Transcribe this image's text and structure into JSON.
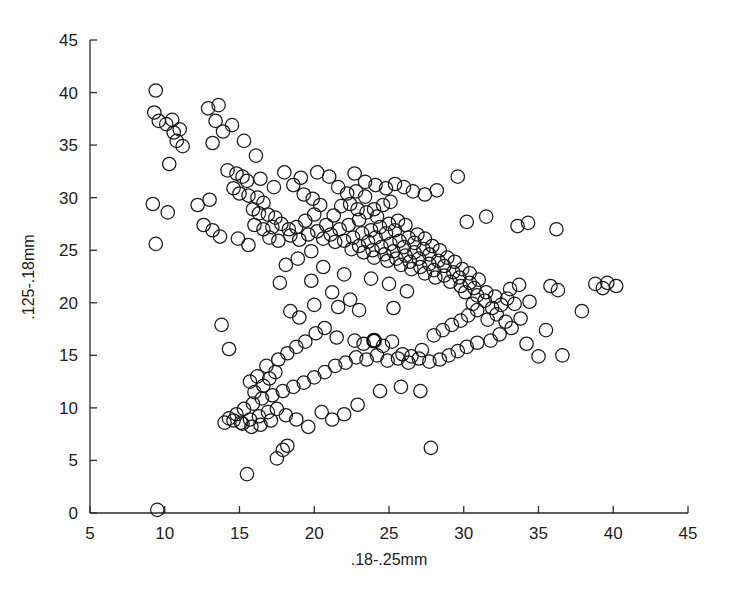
{
  "chart_data": {
    "type": "scatter",
    "title": "",
    "xlabel": ".18-.25mm",
    "ylabel": ".125-.18mm",
    "xlim": [
      5,
      45
    ],
    "ylim": [
      0,
      45
    ],
    "xticks": [
      5,
      10,
      15,
      20,
      25,
      30,
      35,
      40,
      45
    ],
    "yticks": [
      0,
      5,
      10,
      15,
      20,
      25,
      30,
      35,
      40,
      45
    ],
    "xtick_labels": [
      "5",
      "10",
      "15",
      "20",
      "25",
      "30",
      "35",
      "40",
      "45"
    ],
    "ytick_labels": [
      "0",
      "5",
      "10",
      "15",
      "20",
      "25",
      "30",
      "35",
      "40",
      "45"
    ],
    "grid": false,
    "legend": null,
    "marker": "open-circle",
    "marker_color": "#1a1a1a",
    "marker_size_units": 0.9,
    "n_points": 278,
    "series": [
      {
        "name": "samples",
        "points": [
          [
            9.4,
            40.2
          ],
          [
            9.3,
            38.1
          ],
          [
            9.6,
            37.3
          ],
          [
            10.1,
            37.0
          ],
          [
            10.5,
            37.4
          ],
          [
            10.6,
            36.2
          ],
          [
            11.0,
            36.5
          ],
          [
            10.8,
            35.4
          ],
          [
            11.2,
            34.9
          ],
          [
            10.3,
            33.2
          ],
          [
            9.2,
            29.4
          ],
          [
            10.2,
            28.6
          ],
          [
            9.4,
            25.6
          ],
          [
            12.9,
            38.5
          ],
          [
            13.6,
            38.8
          ],
          [
            13.4,
            37.3
          ],
          [
            13.9,
            36.3
          ],
          [
            14.5,
            36.9
          ],
          [
            13.2,
            35.2
          ],
          [
            15.3,
            35.4
          ],
          [
            16.1,
            34.0
          ],
          [
            14.2,
            32.6
          ],
          [
            14.8,
            32.3
          ],
          [
            15.2,
            32.0
          ],
          [
            15.5,
            31.6
          ],
          [
            14.6,
            30.9
          ],
          [
            15.0,
            30.4
          ],
          [
            15.6,
            30.2
          ],
          [
            16.2,
            30.0
          ],
          [
            16.6,
            29.5
          ],
          [
            15.9,
            28.9
          ],
          [
            16.3,
            28.5
          ],
          [
            16.9,
            28.4
          ],
          [
            17.4,
            28.1
          ],
          [
            16.0,
            27.4
          ],
          [
            16.6,
            27.0
          ],
          [
            17.2,
            27.2
          ],
          [
            17.8,
            27.5
          ],
          [
            18.3,
            27.0
          ],
          [
            17.0,
            26.2
          ],
          [
            17.6,
            25.9
          ],
          [
            15.6,
            25.5
          ],
          [
            14.9,
            26.1
          ],
          [
            13.7,
            26.3
          ],
          [
            13.2,
            26.9
          ],
          [
            12.6,
            27.4
          ],
          [
            12.2,
            29.3
          ],
          [
            13.0,
            29.8
          ],
          [
            18.0,
            32.4
          ],
          [
            18.6,
            31.2
          ],
          [
            19.3,
            30.3
          ],
          [
            19.9,
            29.9
          ],
          [
            20.4,
            29.3
          ],
          [
            20.0,
            28.4
          ],
          [
            19.4,
            27.8
          ],
          [
            18.8,
            27.2
          ],
          [
            18.4,
            26.4
          ],
          [
            19.0,
            26.0
          ],
          [
            19.6,
            26.5
          ],
          [
            20.2,
            26.8
          ],
          [
            20.8,
            27.4
          ],
          [
            21.3,
            28.3
          ],
          [
            21.8,
            29.2
          ],
          [
            22.2,
            30.4
          ],
          [
            21.6,
            31.0
          ],
          [
            22.8,
            30.6
          ],
          [
            23.4,
            30.1
          ],
          [
            22.4,
            29.4
          ],
          [
            22.9,
            28.9
          ],
          [
            23.5,
            28.6
          ],
          [
            24.0,
            28.9
          ],
          [
            24.6,
            29.3
          ],
          [
            25.1,
            29.6
          ],
          [
            24.2,
            28.2
          ],
          [
            23.0,
            27.9
          ],
          [
            22.3,
            27.4
          ],
          [
            21.7,
            27.0
          ],
          [
            21.1,
            26.5
          ],
          [
            20.6,
            26.1
          ],
          [
            21.4,
            25.8
          ],
          [
            22.0,
            25.9
          ],
          [
            22.6,
            26.2
          ],
          [
            23.2,
            26.6
          ],
          [
            23.8,
            26.9
          ],
          [
            24.4,
            27.2
          ],
          [
            25.0,
            27.5
          ],
          [
            25.6,
            27.8
          ],
          [
            26.1,
            27.4
          ],
          [
            25.4,
            26.9
          ],
          [
            24.8,
            26.6
          ],
          [
            24.1,
            26.2
          ],
          [
            23.6,
            25.8
          ],
          [
            23.0,
            25.4
          ],
          [
            22.5,
            25.1
          ],
          [
            23.3,
            24.8
          ],
          [
            23.9,
            25.0
          ],
          [
            24.5,
            25.3
          ],
          [
            25.1,
            25.6
          ],
          [
            25.7,
            25.9
          ],
          [
            26.3,
            26.2
          ],
          [
            26.9,
            26.5
          ],
          [
            27.4,
            26.1
          ],
          [
            26.7,
            25.7
          ],
          [
            26.0,
            25.3
          ],
          [
            25.3,
            24.9
          ],
          [
            24.7,
            24.6
          ],
          [
            24.0,
            24.3
          ],
          [
            24.9,
            24.0
          ],
          [
            25.5,
            24.2
          ],
          [
            26.1,
            24.5
          ],
          [
            26.7,
            24.8
          ],
          [
            27.3,
            25.1
          ],
          [
            27.9,
            25.4
          ],
          [
            28.4,
            25.0
          ],
          [
            27.7,
            24.6
          ],
          [
            27.0,
            24.2
          ],
          [
            26.4,
            23.9
          ],
          [
            25.8,
            23.6
          ],
          [
            26.5,
            23.2
          ],
          [
            27.1,
            23.4
          ],
          [
            27.7,
            23.7
          ],
          [
            28.3,
            24.0
          ],
          [
            28.9,
            24.3
          ],
          [
            29.4,
            23.9
          ],
          [
            28.7,
            23.5
          ],
          [
            28.0,
            23.1
          ],
          [
            27.4,
            22.8
          ],
          [
            28.1,
            22.4
          ],
          [
            28.7,
            22.6
          ],
          [
            29.3,
            22.9
          ],
          [
            29.9,
            23.2
          ],
          [
            30.4,
            22.8
          ],
          [
            29.7,
            22.4
          ],
          [
            29.1,
            22.0
          ],
          [
            29.8,
            21.6
          ],
          [
            30.4,
            21.9
          ],
          [
            31.0,
            22.2
          ],
          [
            30.7,
            21.4
          ],
          [
            30.1,
            21.0
          ],
          [
            30.9,
            20.7
          ],
          [
            31.5,
            21.0
          ],
          [
            32.1,
            20.6
          ],
          [
            31.4,
            20.2
          ],
          [
            30.6,
            19.9
          ],
          [
            31.9,
            19.5
          ],
          [
            32.5,
            19.8
          ],
          [
            32.9,
            20.4
          ],
          [
            33.4,
            19.9
          ],
          [
            32.2,
            18.9
          ],
          [
            31.6,
            18.4
          ],
          [
            32.8,
            18.2
          ],
          [
            33.2,
            17.6
          ],
          [
            32.4,
            17.0
          ],
          [
            31.8,
            16.4
          ],
          [
            30.9,
            16.2
          ],
          [
            30.2,
            15.8
          ],
          [
            29.6,
            15.4
          ],
          [
            29.0,
            15.0
          ],
          [
            28.4,
            14.6
          ],
          [
            27.7,
            14.4
          ],
          [
            27.0,
            14.7
          ],
          [
            26.3,
            14.3
          ],
          [
            25.6,
            14.7
          ],
          [
            24.9,
            14.5
          ],
          [
            24.2,
            15.0
          ],
          [
            23.5,
            14.6
          ],
          [
            22.8,
            14.8
          ],
          [
            22.1,
            14.3
          ],
          [
            21.4,
            14.0
          ],
          [
            20.7,
            13.4
          ],
          [
            20.0,
            12.9
          ],
          [
            19.3,
            12.4
          ],
          [
            18.6,
            12.0
          ],
          [
            17.9,
            11.6
          ],
          [
            17.2,
            11.2
          ],
          [
            16.5,
            10.9
          ],
          [
            15.9,
            10.4
          ],
          [
            15.3,
            9.9
          ],
          [
            14.8,
            9.4
          ],
          [
            14.3,
            9.0
          ],
          [
            14.0,
            8.6
          ],
          [
            15.1,
            8.6
          ],
          [
            15.7,
            8.9
          ],
          [
            16.3,
            9.2
          ],
          [
            16.9,
            9.6
          ],
          [
            17.5,
            9.9
          ],
          [
            18.1,
            9.3
          ],
          [
            17.1,
            8.8
          ],
          [
            16.4,
            8.4
          ],
          [
            15.8,
            8.2
          ],
          [
            15.2,
            8.5
          ],
          [
            14.6,
            8.8
          ],
          [
            16.0,
            11.5
          ],
          [
            16.6,
            12.1
          ],
          [
            17.0,
            12.8
          ],
          [
            17.4,
            13.4
          ],
          [
            16.2,
            13.0
          ],
          [
            15.7,
            12.5
          ],
          [
            16.8,
            14.0
          ],
          [
            17.6,
            14.6
          ],
          [
            18.2,
            15.2
          ],
          [
            18.8,
            15.8
          ],
          [
            19.4,
            16.3
          ],
          [
            20.1,
            17.1
          ],
          [
            20.7,
            17.6
          ],
          [
            19.0,
            18.6
          ],
          [
            18.4,
            19.2
          ],
          [
            17.7,
            21.9
          ],
          [
            19.8,
            22.1
          ],
          [
            21.6,
            19.6
          ],
          [
            21.5,
            16.7
          ],
          [
            22.7,
            16.4
          ],
          [
            23.3,
            16.1
          ],
          [
            24.0,
            16.4
          ],
          [
            24.6,
            15.9
          ],
          [
            25.2,
            16.3
          ],
          [
            25.9,
            15.1
          ],
          [
            26.5,
            14.9
          ],
          [
            27.2,
            15.5
          ],
          [
            28.0,
            16.9
          ],
          [
            28.6,
            17.4
          ],
          [
            29.2,
            17.9
          ],
          [
            29.8,
            18.3
          ],
          [
            30.3,
            18.8
          ],
          [
            30.9,
            19.3
          ],
          [
            33.8,
            18.5
          ],
          [
            34.2,
            16.1
          ],
          [
            35.0,
            14.9
          ],
          [
            36.3,
            21.2
          ],
          [
            35.8,
            21.6
          ],
          [
            33.1,
            21.3
          ],
          [
            33.7,
            21.7
          ],
          [
            34.4,
            20.1
          ],
          [
            35.5,
            17.4
          ],
          [
            36.6,
            15.0
          ],
          [
            37.9,
            19.2
          ],
          [
            38.8,
            21.8
          ],
          [
            39.3,
            21.4
          ],
          [
            39.6,
            21.9
          ],
          [
            40.2,
            21.6
          ],
          [
            36.2,
            27.0
          ],
          [
            34.3,
            27.6
          ],
          [
            33.6,
            27.3
          ],
          [
            31.5,
            28.2
          ],
          [
            30.2,
            27.7
          ],
          [
            29.6,
            32.0
          ],
          [
            28.2,
            30.7
          ],
          [
            27.4,
            30.3
          ],
          [
            26.6,
            30.6
          ],
          [
            26.0,
            31.0
          ],
          [
            25.4,
            31.3
          ],
          [
            24.8,
            30.9
          ],
          [
            24.1,
            31.2
          ],
          [
            23.4,
            31.5
          ],
          [
            22.7,
            32.3
          ],
          [
            21.0,
            32.0
          ],
          [
            20.2,
            32.4
          ],
          [
            19.1,
            31.9
          ],
          [
            17.3,
            31.0
          ],
          [
            16.4,
            31.8
          ],
          [
            19.8,
            24.9
          ],
          [
            18.9,
            24.2
          ],
          [
            18.1,
            23.6
          ],
          [
            20.6,
            23.4
          ],
          [
            22.0,
            22.7
          ],
          [
            23.8,
            22.3
          ],
          [
            25.0,
            21.8
          ],
          [
            26.2,
            21.1
          ],
          [
            21.2,
            21.0
          ],
          [
            22.4,
            20.3
          ],
          [
            24.4,
            11.6
          ],
          [
            25.8,
            12.0
          ],
          [
            27.1,
            11.6
          ],
          [
            22.9,
            10.3
          ],
          [
            22.0,
            9.4
          ],
          [
            21.2,
            8.9
          ],
          [
            20.5,
            9.6
          ],
          [
            19.6,
            8.2
          ],
          [
            18.8,
            8.9
          ],
          [
            18.2,
            6.4
          ],
          [
            17.9,
            6.0
          ],
          [
            17.5,
            5.2
          ],
          [
            15.5,
            3.7
          ],
          [
            27.8,
            6.2
          ],
          [
            9.5,
            0.3
          ],
          [
            20.0,
            19.8
          ],
          [
            23.0,
            19.3
          ],
          [
            25.3,
            19.5
          ],
          [
            14.3,
            15.6
          ],
          [
            13.8,
            17.9
          ]
        ]
      }
    ],
    "bold_marker_index": 213
  },
  "axes": {
    "x_axis_name": "x-axis",
    "y_axis_name": "y-axis"
  }
}
